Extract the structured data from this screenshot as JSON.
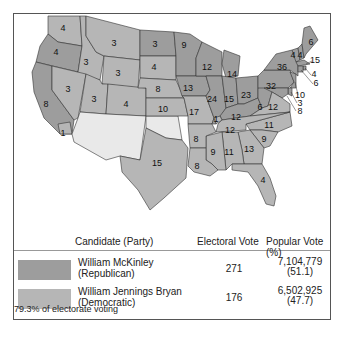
{
  "map": {
    "title": "Election of 1896",
    "colors": {
      "republican": "#9d9d9d",
      "democratic": "#b6b6b6",
      "territory": "#e9e9e9"
    },
    "states": [
      {
        "name": "Washington",
        "votes": "4",
        "party": "dem"
      },
      {
        "name": "Oregon",
        "votes": "4",
        "party": "rep"
      },
      {
        "name": "California",
        "votes": "8",
        "party": "rep"
      },
      {
        "name": "California-split",
        "votes": "1",
        "party": "dem"
      },
      {
        "name": "Idaho",
        "votes": "3",
        "party": "dem"
      },
      {
        "name": "Nevada",
        "votes": "3",
        "party": "dem"
      },
      {
        "name": "Montana",
        "votes": "3",
        "party": "dem"
      },
      {
        "name": "Wyoming",
        "votes": "3",
        "party": "dem"
      },
      {
        "name": "Utah",
        "votes": "3",
        "party": "dem"
      },
      {
        "name": "Colorado",
        "votes": "4",
        "party": "dem"
      },
      {
        "name": "North Dakota",
        "votes": "3",
        "party": "rep"
      },
      {
        "name": "South Dakota",
        "votes": "4",
        "party": "dem"
      },
      {
        "name": "Nebraska",
        "votes": "8",
        "party": "dem"
      },
      {
        "name": "Kansas",
        "votes": "10",
        "party": "dem"
      },
      {
        "name": "Minnesota",
        "votes": "9",
        "party": "rep"
      },
      {
        "name": "Iowa",
        "votes": "13",
        "party": "rep"
      },
      {
        "name": "Missouri",
        "votes": "17",
        "party": "dem"
      },
      {
        "name": "Wisconsin",
        "votes": "12",
        "party": "rep"
      },
      {
        "name": "Illinois",
        "votes": "24",
        "party": "rep"
      },
      {
        "name": "Michigan",
        "votes": "14",
        "party": "rep"
      },
      {
        "name": "Indiana",
        "votes": "15",
        "party": "rep"
      },
      {
        "name": "Ohio",
        "votes": "23",
        "party": "rep"
      },
      {
        "name": "Kentucky",
        "votes": "12",
        "party": "rep"
      },
      {
        "name": "Kentucky-split",
        "votes": "1",
        "party": "dem"
      },
      {
        "name": "West Virginia",
        "votes": "6",
        "party": "rep"
      },
      {
        "name": "Pennsylvania",
        "votes": "32",
        "party": "rep"
      },
      {
        "name": "New York",
        "votes": "36",
        "party": "rep"
      },
      {
        "name": "Vermont",
        "votes": "4",
        "party": "rep"
      },
      {
        "name": "New Hampshire",
        "votes": "4",
        "party": "rep"
      },
      {
        "name": "Maine",
        "votes": "6",
        "party": "rep"
      },
      {
        "name": "Massachusetts",
        "votes": "15",
        "party": "rep"
      },
      {
        "name": "Rhode Island",
        "votes": "4",
        "party": "rep"
      },
      {
        "name": "Connecticut",
        "votes": "6",
        "party": "rep"
      },
      {
        "name": "New Jersey",
        "votes": "10",
        "party": "rep"
      },
      {
        "name": "Delaware",
        "votes": "3",
        "party": "rep"
      },
      {
        "name": "Maryland",
        "votes": "8",
        "party": "rep"
      },
      {
        "name": "Virginia",
        "votes": "12",
        "party": "dem"
      },
      {
        "name": "North Carolina",
        "votes": "11",
        "party": "dem"
      },
      {
        "name": "Tennessee",
        "votes": "12",
        "party": "dem"
      },
      {
        "name": "South Carolina",
        "votes": "9",
        "party": "dem"
      },
      {
        "name": "Georgia",
        "votes": "13",
        "party": "dem"
      },
      {
        "name": "Alabama",
        "votes": "11",
        "party": "dem"
      },
      {
        "name": "Mississippi",
        "votes": "9",
        "party": "dem"
      },
      {
        "name": "Arkansas",
        "votes": "8",
        "party": "dem"
      },
      {
        "name": "Louisiana",
        "votes": "8",
        "party": "dem"
      },
      {
        "name": "Texas",
        "votes": "15",
        "party": "dem"
      },
      {
        "name": "Florida",
        "votes": "4",
        "party": "dem"
      }
    ]
  },
  "table": {
    "headers": {
      "candidate": "Candidate (Party)",
      "electoral": "Electoral Vote",
      "popular": "Popular Vote (%)"
    },
    "rows": [
      {
        "name": "William McKinley",
        "party": "(Republican)",
        "electoral": "271",
        "popular": "7,104,779",
        "percent": "(51.1)",
        "color": "#9d9d9d"
      },
      {
        "name": "William Jennings Bryan",
        "party": "(Democratic)",
        "electoral": "176",
        "popular": "6,502,925",
        "percent": "(47.7)",
        "color": "#b6b6b6"
      }
    ],
    "note": "79.3% of electorate voting"
  }
}
